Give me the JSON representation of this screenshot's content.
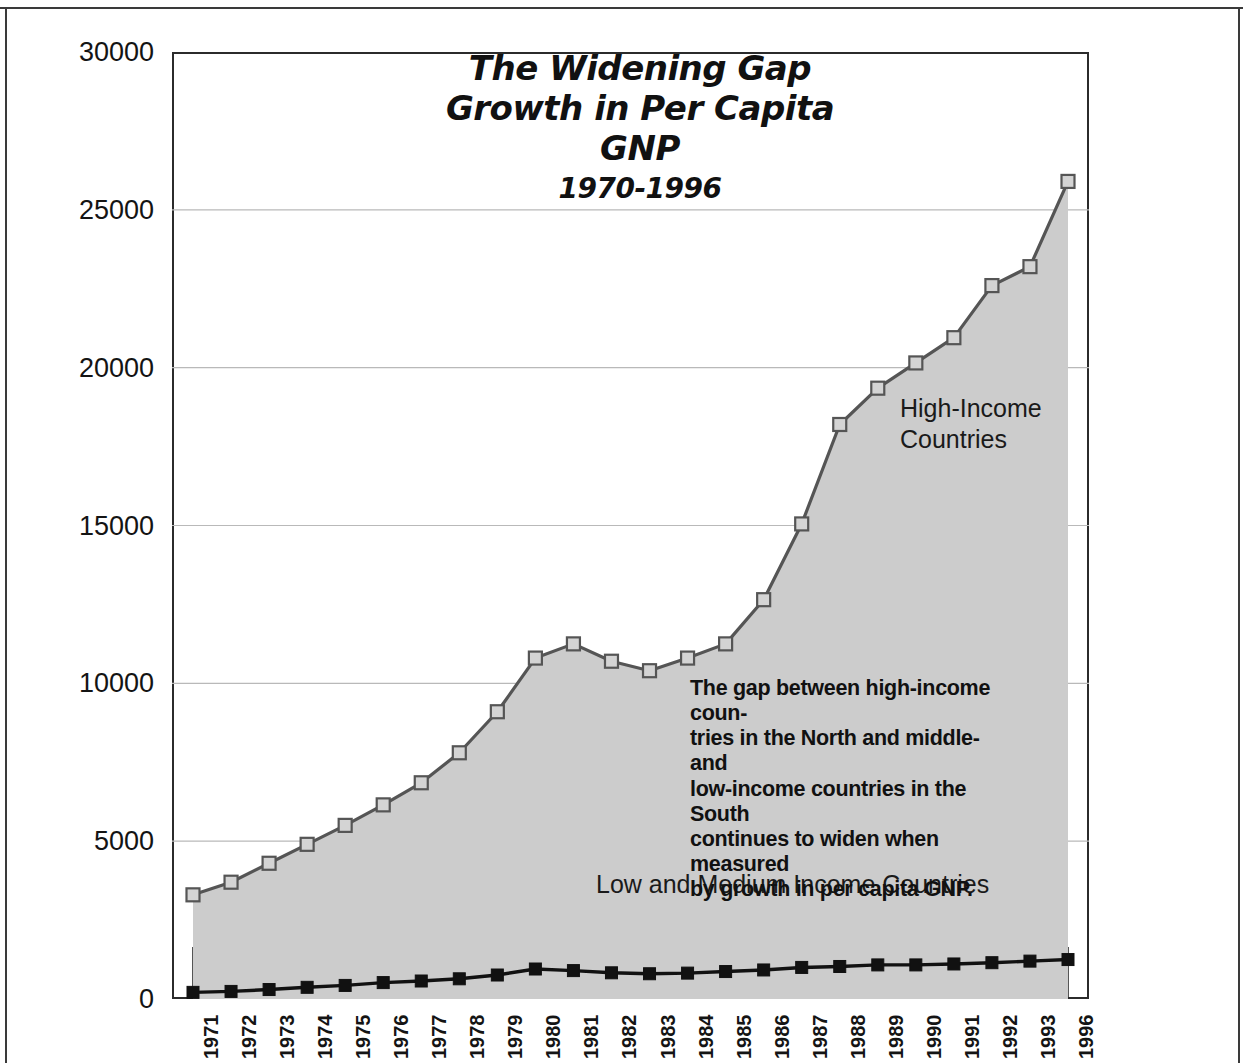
{
  "title": {
    "line1": "The Widening Gap",
    "line2": "Growth in Per Capita GNP",
    "line3": "1970-1996"
  },
  "labels": {
    "high_income": "High-Income\nCountries",
    "low_income": "Low and Medium Income Countries"
  },
  "annotation": "The gap between high-income coun-\ntries in the North and middle- and\nlow-income countries in the South\ncontinues to widen when measured\nby growth in per capita GNP.",
  "colors": {
    "area_fill": "#cccccc",
    "high_line": "#555555",
    "high_marker_fill": "#d4d4d4",
    "low_line": "#111111",
    "low_marker_fill": "#111111",
    "frame": "#2b2b2b",
    "grid": "#b9b9b9",
    "text": "#111111"
  },
  "chart_data": {
    "type": "line",
    "xlabel": "",
    "ylabel": "",
    "ylim": [
      0,
      30000
    ],
    "yticks": [
      0,
      5000,
      10000,
      15000,
      20000,
      25000,
      30000
    ],
    "ytick_labels": [
      "0",
      "5000",
      "10000",
      "15000",
      "20000",
      "25000",
      "30000"
    ],
    "grid": true,
    "legend": "inline-labels",
    "categories": [
      "1971",
      "1972",
      "1973",
      "1974",
      "1975",
      "1976",
      "1977",
      "1978",
      "1979",
      "1980",
      "1981",
      "1982",
      "1983",
      "1984",
      "1985",
      "1986",
      "1987",
      "1988",
      "1989",
      "1990",
      "1991",
      "1992",
      "1993",
      "1996"
    ],
    "series": [
      {
        "name": "High-Income Countries",
        "marker": "square-open",
        "filled_area": true,
        "values": [
          3300,
          3700,
          4300,
          4900,
          5500,
          6150,
          6850,
          7800,
          9100,
          10800,
          11250,
          10700,
          10400,
          10800,
          11250,
          12650,
          15050,
          18200,
          19350,
          20150,
          20950,
          22600,
          23200,
          25900
        ]
      },
      {
        "name": "Low and Medium Income Countries",
        "marker": "square-filled",
        "filled_area": false,
        "values": [
          210,
          240,
          300,
          370,
          430,
          520,
          570,
          640,
          760,
          950,
          900,
          830,
          800,
          820,
          870,
          920,
          1000,
          1030,
          1080,
          1080,
          1110,
          1150,
          1200,
          1250
        ]
      }
    ]
  }
}
